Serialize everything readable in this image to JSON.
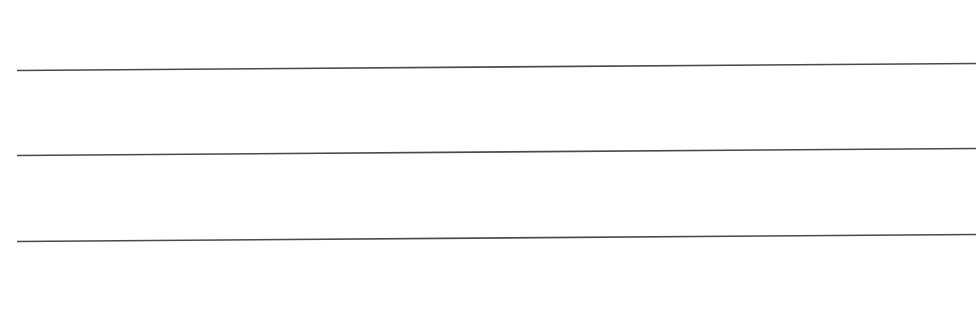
{
  "page": {
    "background": "#ffffff",
    "line_color": "#4a4a4a",
    "lines": [
      {
        "x1": 17,
        "y1": 70.5,
        "x2": 976,
        "y2": 63.5
      },
      {
        "x1": 17,
        "y1": 155.5,
        "x2": 976,
        "y2": 148.5
      },
      {
        "x1": 17,
        "y1": 241.5,
        "x2": 976,
        "y2": 234.5
      }
    ]
  }
}
